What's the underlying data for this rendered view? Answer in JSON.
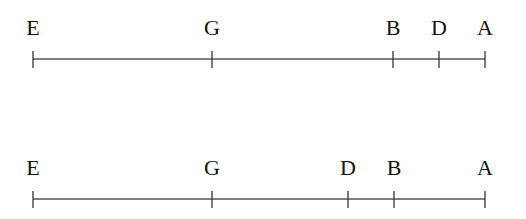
{
  "diagram": {
    "type": "number-line-comparison",
    "colors": {
      "line": "#555555",
      "tick": "#333333",
      "text": "#111111",
      "background": "#ffffff"
    },
    "lines": [
      {
        "name": "top-line",
        "y": 59,
        "x_start": 33,
        "x_end": 485,
        "points": [
          {
            "label": "E",
            "x": 33
          },
          {
            "label": "G",
            "x": 212
          },
          {
            "label": "B",
            "x": 393
          },
          {
            "label": "D",
            "x": 439
          },
          {
            "label": "A",
            "x": 485
          }
        ]
      },
      {
        "name": "bottom-line",
        "y": 199,
        "x_start": 33,
        "x_end": 485,
        "points": [
          {
            "label": "E",
            "x": 33
          },
          {
            "label": "G",
            "x": 212
          },
          {
            "label": "D",
            "x": 348
          },
          {
            "label": "B",
            "x": 394
          },
          {
            "label": "A",
            "x": 485
          }
        ]
      }
    ]
  }
}
